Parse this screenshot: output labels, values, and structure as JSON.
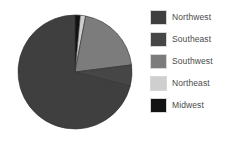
{
  "chart_data": {
    "type": "pie",
    "title": "",
    "subtitle": "",
    "xlabel": "",
    "ylabel": "",
    "grid": false,
    "legend_position": "right",
    "start_angle_deg": 0,
    "direction": "clockwise",
    "categories": [
      "Northwest",
      "Southeast",
      "Southwest",
      "Northeast",
      "Midwest"
    ],
    "values": [
      71,
      6,
      20,
      1.5,
      1.5
    ],
    "value_unit": "percent",
    "slices": [
      {
        "label": "Northwest",
        "value": 71,
        "angle_deg": 255.6,
        "color": "#3f3f3f",
        "draw_order": 5,
        "sweep_start_deg": 104.4,
        "sweep_end_deg": 360
      },
      {
        "label": "Southeast",
        "value": 6,
        "angle_deg": 21.6,
        "color": "#464646",
        "draw_order": 4,
        "sweep_start_deg": 82.8,
        "sweep_end_deg": 104.4
      },
      {
        "label": "Southwest",
        "value": 20,
        "angle_deg": 72,
        "color": "#7c7c7c",
        "draw_order": 3,
        "sweep_start_deg": 10.8,
        "sweep_end_deg": 82.8
      },
      {
        "label": "Northeast",
        "value": 1.5,
        "angle_deg": 5.4,
        "color": "#cfcfcf",
        "draw_order": 2,
        "sweep_start_deg": 5.4,
        "sweep_end_deg": 10.8
      },
      {
        "label": "Midwest",
        "value": 1.5,
        "angle_deg": 5.4,
        "color": "#131313",
        "draw_order": 1,
        "sweep_start_deg": 0,
        "sweep_end_deg": 5.4
      }
    ]
  },
  "legend": {
    "items": [
      {
        "label": "Northwest",
        "color": "#3f3f3f"
      },
      {
        "label": "Southeast",
        "color": "#464646"
      },
      {
        "label": "Southwest",
        "color": "#7c7c7c"
      },
      {
        "label": "Northeast",
        "color": "#cfcfcf"
      },
      {
        "label": "Midwest",
        "color": "#131313"
      }
    ]
  },
  "colors": {
    "background": "#ffffff",
    "text": "#4a4a4a",
    "swatch_border": "#d8d8d8",
    "slice_edge": "#2e2e2e"
  }
}
